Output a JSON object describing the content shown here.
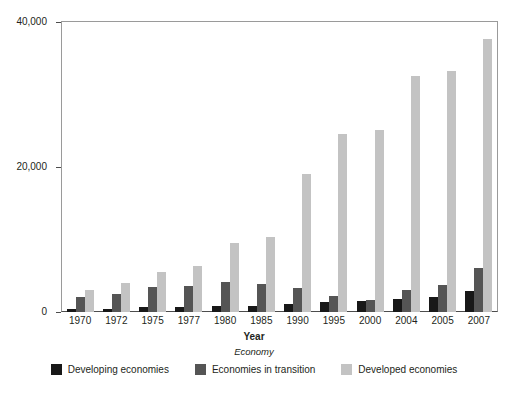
{
  "chart_data": {
    "type": "bar",
    "title": "",
    "xlabel": "Year",
    "ylabel": "",
    "legend_title": "Economy",
    "legend_position": "bottom",
    "grid": false,
    "ylim": [
      0,
      40000
    ],
    "ytick_labels": [
      "40,000",
      "20,000",
      "0"
    ],
    "ytick_values": [
      40000,
      20000,
      0
    ],
    "categories": [
      "1970",
      "1972",
      "1975",
      "1977",
      "1980",
      "1985",
      "1990",
      "1995",
      "2000",
      "2004",
      "2005",
      "2007"
    ],
    "series": [
      {
        "name": "Developing economies",
        "color": "#181818",
        "values": [
          350,
          450,
          650,
          700,
          850,
          800,
          1100,
          1350,
          1500,
          1800,
          2100,
          2900
        ]
      },
      {
        "name": "Economies in transition",
        "color": "#555555",
        "values": [
          2100,
          2500,
          3400,
          3600,
          4200,
          3800,
          3300,
          2200,
          1700,
          3000,
          3700,
          6100
        ]
      },
      {
        "name": "Developed economies",
        "color": "#c3c3c3",
        "values": [
          3100,
          4000,
          5500,
          6400,
          9500,
          10400,
          19000,
          24600,
          25100,
          32500,
          33200,
          37600
        ]
      }
    ]
  },
  "axes": {
    "y_ticks": [
      {
        "label": "40,000",
        "value": 40000
      },
      {
        "label": "20,000",
        "value": 20000
      },
      {
        "label": "0",
        "value": 0
      }
    ],
    "x_title": "Year"
  },
  "legend": {
    "title": "Economy",
    "items": [
      {
        "label": "Developing economies",
        "color": "#181818",
        "key": "developing"
      },
      {
        "label": "Economies in transition",
        "color": "#555555",
        "key": "transition"
      },
      {
        "label": "Developed economies",
        "color": "#c3c3c3",
        "key": "developed"
      }
    ]
  }
}
